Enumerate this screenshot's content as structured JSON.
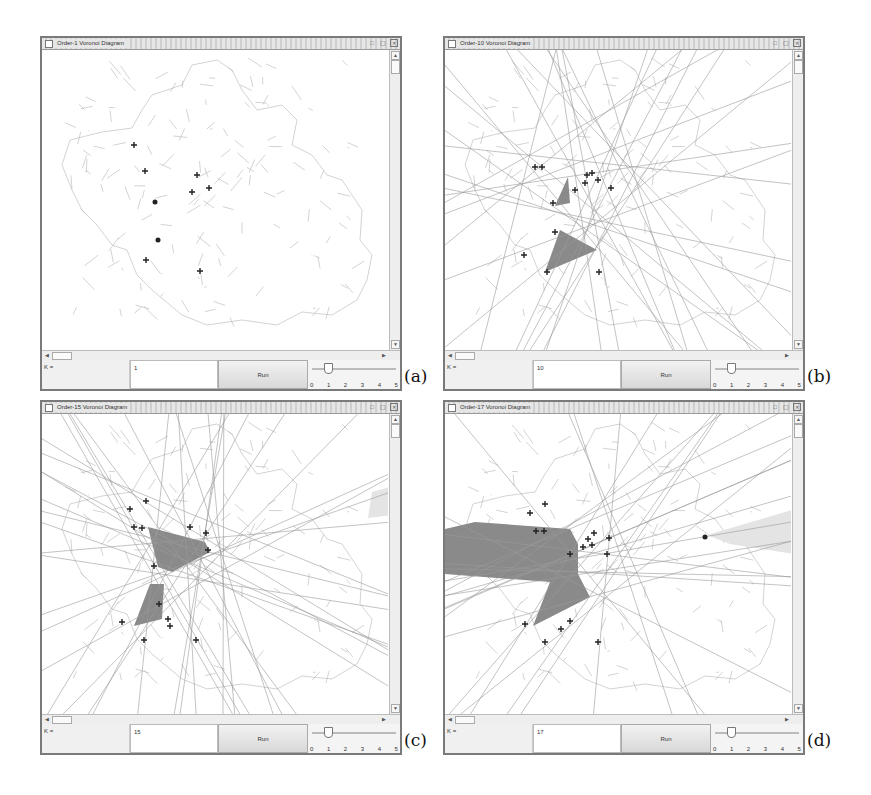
{
  "figure": {
    "panels": [
      {
        "id": "a",
        "label": "(a)",
        "window_title": "Order-1 Voronoi Diagram",
        "k_label": "K =",
        "k_value": "1",
        "run_label": "Run",
        "slider_ticks": [
          "0",
          "1",
          "2",
          "3",
          "4",
          "5"
        ],
        "slider_value": 1,
        "shaded_regions": 0
      },
      {
        "id": "b",
        "label": "(b)",
        "window_title": "Order-10 Voronoi Diagram",
        "k_label": "K =",
        "k_value": "10",
        "run_label": "Run",
        "slider_ticks": [
          "0",
          "1",
          "2",
          "3",
          "4",
          "5"
        ],
        "slider_value": 1,
        "shaded_regions": 2
      },
      {
        "id": "c",
        "label": "(c)",
        "window_title": "Order-15 Voronoi Diagram",
        "k_label": "K =",
        "k_value": "15",
        "run_label": "Run",
        "slider_ticks": [
          "0",
          "1",
          "2",
          "3",
          "4",
          "5"
        ],
        "slider_value": 1,
        "shaded_regions": 3
      },
      {
        "id": "d",
        "label": "(d)",
        "window_title": "Order-17 Voronoi Diagram",
        "k_label": "K =",
        "k_value": "17",
        "run_label": "Run",
        "slider_ticks": [
          "0",
          "1",
          "2",
          "3",
          "4",
          "5"
        ],
        "slider_value": 1,
        "shaded_regions": 2
      }
    ],
    "window_buttons": [
      "restore-icon",
      "maximize-icon",
      "close-icon"
    ],
    "colors": {
      "shade_dark": "#8a8a8a",
      "shade_light": "#e4e4e4",
      "map_lines": "#b5b5b5",
      "voronoi_lines": "#9a9a9a",
      "markers": "#222222"
    }
  }
}
